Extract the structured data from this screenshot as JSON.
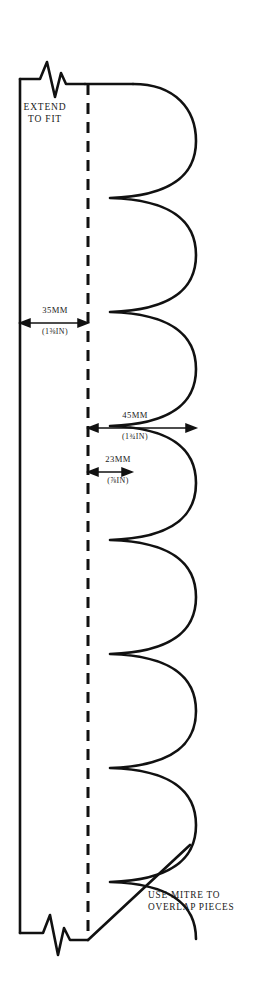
{
  "diagram": {
    "type": "technical-sewing-pattern",
    "stroke_color": "#111111",
    "background_color": "#ffffff",
    "annotations": {
      "extend_to_fit": "EXTEND\nTO FIT",
      "mitre_note": "USE MITRE TO\nOVERLAP PIECES"
    },
    "dimensions": [
      {
        "id": "hem-depth",
        "metric": "35MM",
        "imperial": "(1⅜IN)",
        "describes": "distance from left edge to dashed fold line",
        "arrow": "double-headed-horizontal"
      },
      {
        "id": "scallop-width",
        "metric": "45MM",
        "imperial": "(1¾IN)",
        "describes": "width of each scallop from fold line to scallop apex",
        "arrow": "double-headed-horizontal"
      },
      {
        "id": "cusp-offset",
        "metric": "23MM",
        "imperial": "(⅞IN)",
        "describes": "distance from fold line to scallop cusp point",
        "arrow": "double-headed-horizontal"
      }
    ],
    "features": [
      {
        "name": "left-edge",
        "style": "solid",
        "orientation": "vertical"
      },
      {
        "name": "fold-line",
        "style": "dashed",
        "orientation": "vertical"
      },
      {
        "name": "scalloped-edge",
        "style": "solid",
        "count": 8
      },
      {
        "name": "break-symbol-top",
        "style": "zigzag"
      },
      {
        "name": "break-symbol-bottom",
        "style": "zigzag"
      },
      {
        "name": "mitre-line",
        "style": "solid",
        "orientation": "diagonal"
      }
    ]
  }
}
